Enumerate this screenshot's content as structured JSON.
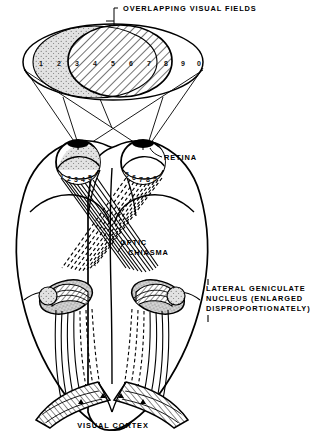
{
  "figure": {
    "background_color": "#ffffff",
    "ink_color": "#000000",
    "width": 312,
    "height": 436
  },
  "labels": {
    "overlapping_visual_fields": "OVERLAPPING VISUAL FIELDS",
    "retina": "RETINA",
    "optic_line1": "OPTIC",
    "optic_line2": "CHIASMA",
    "lgn_line1": "LATERAL GENICULATE",
    "lgn_line2": "NUCLEUS (ENLARGED",
    "lgn_line3": "DISPROPORTIONATELY)",
    "visual_cortex": "VISUAL CORTEX"
  },
  "visual_field": {
    "digits": [
      "1",
      "2",
      "3",
      "4",
      "5",
      "6",
      "7",
      "8",
      "9",
      "0"
    ],
    "shaded_left_fill": "#d8d8d8",
    "overlap_hatch_fill": "#ffffff"
  },
  "retina_markers": {
    "left_eye_digits": [
      "1",
      "2",
      "3",
      "4",
      "5",
      "6"
    ],
    "right_eye_digits": [
      "5",
      "6",
      "7",
      "8",
      "9",
      "0"
    ]
  }
}
